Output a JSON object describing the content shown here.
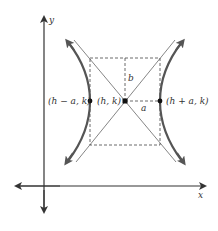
{
  "figure": {
    "type": "hyperbola-horizontal-transverse-axis",
    "axes": {
      "x_label": "x",
      "y_label": "y"
    },
    "points": [
      {
        "id": "left-vertex",
        "label": "(h − a, k)"
      },
      {
        "id": "center",
        "label": "(h, k)"
      },
      {
        "id": "right-vertex",
        "label": "(h + a, k)"
      }
    ],
    "segments": {
      "vertical_label": "b",
      "horizontal_label": "a"
    },
    "colors": {
      "curve": "#555555",
      "axis": "#333333",
      "dashed": "#444444",
      "asymptote": "#666666"
    }
  }
}
